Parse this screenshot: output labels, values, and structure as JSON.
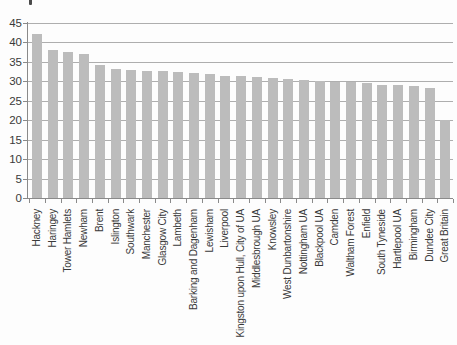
{
  "page": {
    "artifact": "stray-ink-mark-top-left"
  },
  "chart_data": {
    "type": "bar",
    "title": "",
    "xlabel": "",
    "ylabel": "",
    "categories": [
      "Hackney",
      "Haringey",
      "Tower Hamlets",
      "Newham",
      "Brent",
      "Islington",
      "Southwark",
      "Manchester",
      "Glasgow City",
      "Lambeth",
      "Barking and Dagenham",
      "Lewisham",
      "Liverpool",
      "Kingston upon Hull, City of UA",
      "Middlesbrough UA",
      "Knowsley",
      "West Dunbartonshire",
      "Nottingham UA",
      "Blackpool UA",
      "Camden",
      "Waltham Forest",
      "Enfield",
      "South Tyneside",
      "Hartlepool UA",
      "Birmingham",
      "Dundee City",
      "Great Britain"
    ],
    "values": [
      42.3,
      38.0,
      37.5,
      37.1,
      34.3,
      33.3,
      33.0,
      32.7,
      32.6,
      32.4,
      32.2,
      32.0,
      31.5,
      31.4,
      31.1,
      30.9,
      30.6,
      30.4,
      30.1,
      29.9,
      29.8,
      29.5,
      29.1,
      29.0,
      28.7,
      28.4,
      20.0
    ],
    "yticks": [
      0,
      5,
      10,
      15,
      20,
      25,
      30,
      35,
      40,
      45
    ],
    "ytick_labels": [
      "0",
      "5",
      "10",
      "15",
      "20",
      "25",
      "30",
      "35",
      "40",
      "45"
    ],
    "ylim": [
      0,
      45
    ],
    "grid": true,
    "legend": null,
    "colors": {
      "bar": "#bcbcbc",
      "gridline": "#aeaeae",
      "axis": "#8a8a8a",
      "text": "#3a3a3a",
      "background": "#fdfdfd"
    }
  }
}
